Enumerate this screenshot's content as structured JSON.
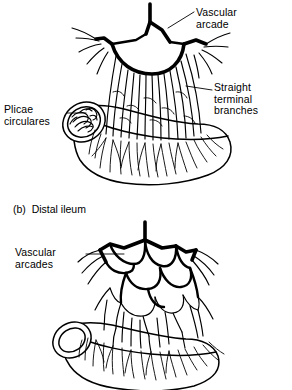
{
  "figure": {
    "ink_color": "#000000",
    "background_color": "#ffffff"
  },
  "panels": [
    {
      "id": "panel-a",
      "caption": "",
      "subject": "Proximal jejunum",
      "labels": [
        {
          "id": "vascular-arcade",
          "text": "Vascular\narcade",
          "side": "right"
        },
        {
          "id": "straight-terminal-branches",
          "text": "Straight\nterminal\nbranches",
          "side": "right"
        },
        {
          "id": "plicae-circulares",
          "text": "Plicae\ncirculares",
          "side": "left"
        }
      ]
    },
    {
      "id": "panel-b",
      "caption": "(b)  Distal ileum",
      "subject": "Distal ileum",
      "labels": [
        {
          "id": "vascular-arcades",
          "text": "Vascular\narcades",
          "side": "left"
        }
      ]
    }
  ],
  "labels": {
    "vascular_arcade": "Vascular\narcade",
    "straight_terminal_branches": "Straight\nterminal\nbranches",
    "plicae_circulares": "Plicae\ncirculares",
    "vascular_arcades": "Vascular\narcades"
  },
  "captions": {
    "panel_b": "(b)  Distal ileum"
  }
}
